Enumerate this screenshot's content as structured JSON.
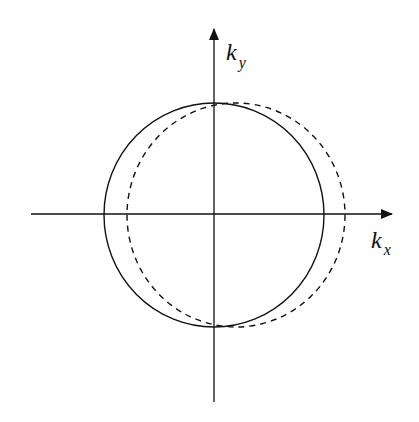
{
  "diagram": {
    "type": "k-space circle diagram",
    "axes": {
      "x_label": "k",
      "x_subscript": "x",
      "y_label": "k",
      "y_subscript": "y",
      "color": "#111111"
    },
    "shapes": [
      {
        "name": "solid-circle",
        "style": "solid",
        "cx": 214,
        "cy": 215,
        "r": 110
      },
      {
        "name": "dashed-circle",
        "style": "dashed",
        "cx": 236,
        "cy": 215,
        "r": 109
      }
    ]
  }
}
